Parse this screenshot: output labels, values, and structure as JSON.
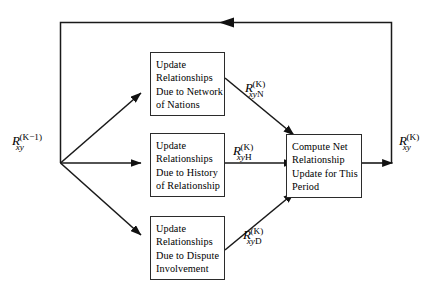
{
  "diagram": {
    "type": "flow-diagram",
    "background_color": "#ffffff",
    "line_color": "#1a1a1a",
    "box_border_color": "#2b2b2b",
    "boxes": [
      {
        "id": "network",
        "text": "Update\nRelationships\nDue to Network\nof Nations",
        "lines": [
          "Update",
          "Relationships",
          "Due to Network",
          "of Nations"
        ]
      },
      {
        "id": "history",
        "text": "Update\nRelationships\nDue to History\nof Relationship",
        "lines": [
          "Update",
          "Relationships",
          "Due to History",
          "of Relationship"
        ]
      },
      {
        "id": "dispute",
        "text": "Update\nRelationships\nDue to Dispute\nInvolvement",
        "lines": [
          "Update",
          "Relationships",
          "Due to Dispute",
          "Involvement"
        ]
      },
      {
        "id": "compute",
        "text": "Compute Net\nRelationship\nUpdate for This\nPeriod",
        "lines": [
          "Compute Net",
          "Relationship",
          "Update for This",
          "Period"
        ]
      }
    ],
    "labels": {
      "input": {
        "base": "R",
        "sub": "xy",
        "sup": "(K−1)",
        "plain": "R_xy^(K-1)"
      },
      "network_out": {
        "base": "R",
        "sub_italic": "xy",
        "sub_upright": "N",
        "sup": "(K)",
        "plain": "R_xyN^(K)"
      },
      "history_out": {
        "base": "R",
        "sub_italic": "xy",
        "sub_upright": "H",
        "sup": "(K)",
        "plain": "R_xyH^(K)"
      },
      "dispute_out": {
        "base": "R",
        "sub_italic": "xy",
        "sub_upright": "D",
        "sup": "(K)",
        "plain": "R_xyD^(K)"
      },
      "output": {
        "base": "R",
        "sub": "xy",
        "sup": "(K)",
        "plain": "R_xy^(K)"
      }
    },
    "edges": [
      {
        "from": "input",
        "to": "network",
        "style": "diagonal-up"
      },
      {
        "from": "input",
        "to": "history",
        "style": "horizontal"
      },
      {
        "from": "input",
        "to": "dispute",
        "style": "diagonal-down"
      },
      {
        "from": "network",
        "to": "compute",
        "style": "diagonal-down"
      },
      {
        "from": "history",
        "to": "compute",
        "style": "horizontal"
      },
      {
        "from": "dispute",
        "to": "compute",
        "style": "diagonal-up"
      },
      {
        "from": "compute",
        "to": "output",
        "style": "horizontal"
      },
      {
        "from": "output",
        "to": "input",
        "style": "feedback-loop-top"
      }
    ]
  }
}
